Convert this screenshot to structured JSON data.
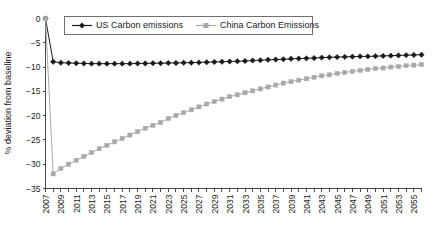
{
  "chart_data": {
    "type": "line",
    "title": "",
    "xlabel": "",
    "ylabel": "% deviation from baseline",
    "ylim": [
      -35,
      0
    ],
    "xlim": [
      2007,
      2056
    ],
    "grid": false,
    "legend_position": "top-center",
    "y_ticks": [
      0,
      -5,
      -10,
      -15,
      -20,
      -25,
      -30,
      -35
    ],
    "y_tick_labels": [
      "0",
      "−5",
      "−10",
      "−15",
      "−20",
      "−25",
      "−30",
      "−35"
    ],
    "x_tick_labels": [
      "2007",
      "2009",
      "2011",
      "2013",
      "2015",
      "2017",
      "2019",
      "2021",
      "2023",
      "2025",
      "2027",
      "2029",
      "2031",
      "2033",
      "2035",
      "2037",
      "2039",
      "2041",
      "2043",
      "2045",
      "2047",
      "2049",
      "2051",
      "2053",
      "2055"
    ],
    "x": [
      2007,
      2008,
      2009,
      2010,
      2011,
      2012,
      2013,
      2014,
      2015,
      2016,
      2017,
      2018,
      2019,
      2020,
      2021,
      2022,
      2023,
      2024,
      2025,
      2026,
      2027,
      2028,
      2029,
      2030,
      2031,
      2032,
      2033,
      2034,
      2035,
      2036,
      2037,
      2038,
      2039,
      2040,
      2041,
      2042,
      2043,
      2044,
      2045,
      2046,
      2047,
      2048,
      2049,
      2050,
      2051,
      2052,
      2053,
      2054,
      2055,
      2056
    ],
    "series": [
      {
        "name": "US Carbon emissions",
        "color": "#1a1a1a",
        "marker": "diamond",
        "values": [
          0,
          -8.9,
          -9.1,
          -9.15,
          -9.2,
          -9.25,
          -9.3,
          -9.3,
          -9.3,
          -9.3,
          -9.3,
          -9.3,
          -9.25,
          -9.25,
          -9.2,
          -9.2,
          -9.15,
          -9.15,
          -9.1,
          -9.1,
          -9.05,
          -9.0,
          -8.95,
          -8.9,
          -8.85,
          -8.8,
          -8.75,
          -8.65,
          -8.6,
          -8.5,
          -8.45,
          -8.4,
          -8.3,
          -8.25,
          -8.2,
          -8.15,
          -8.05,
          -8.0,
          -7.95,
          -7.9,
          -7.85,
          -7.8,
          -7.8,
          -7.75,
          -7.7,
          -7.65,
          -7.6,
          -7.55,
          -7.5,
          -7.45
        ]
      },
      {
        "name": "China Carbon Emissions",
        "color": "#a8a8a8",
        "marker": "square",
        "values": [
          0,
          -32.0,
          -30.9,
          -30.0,
          -29.2,
          -28.4,
          -27.6,
          -26.8,
          -26.1,
          -25.4,
          -24.7,
          -24.0,
          -23.3,
          -22.6,
          -22.0,
          -21.4,
          -20.6,
          -20.0,
          -19.4,
          -18.8,
          -18.2,
          -17.6,
          -17.1,
          -16.6,
          -16.1,
          -15.7,
          -15.3,
          -14.9,
          -14.5,
          -14.1,
          -13.7,
          -13.3,
          -13.0,
          -12.7,
          -12.4,
          -12.1,
          -11.8,
          -11.6,
          -11.3,
          -11.1,
          -10.9,
          -10.7,
          -10.5,
          -10.3,
          -10.2,
          -10.0,
          -9.9,
          -9.7,
          -9.6,
          -9.5
        ]
      }
    ]
  }
}
